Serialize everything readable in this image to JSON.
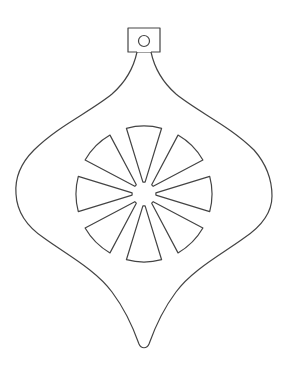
{
  "figure": {
    "stroke_color": "#444444",
    "fill_color": "#ffffff",
    "background": "#ffffff",
    "hanger": {
      "x": 128,
      "y": 28,
      "width": 32,
      "height": 24,
      "hole_cx": 144,
      "hole_cy": 41,
      "hole_r": 5.5
    },
    "center": {
      "cx": 144,
      "cy": 194
    },
    "wedges": {
      "count": 8,
      "inner_radius": 12,
      "outer_radius": 68,
      "span_degrees": 30
    }
  }
}
